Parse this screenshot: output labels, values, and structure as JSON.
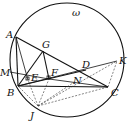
{
  "diagram": {
    "type": "geometry",
    "circle": {
      "name": "ω",
      "cx": 67,
      "cy": 60,
      "r": 57
    },
    "points": {
      "A": {
        "x": 16,
        "y": 37,
        "lx": 6,
        "ly": 38,
        "label": "A"
      },
      "G": {
        "x": 43,
        "y": 51,
        "lx": 42,
        "ly": 48,
        "label": "G"
      },
      "M": {
        "x": 10,
        "y": 72,
        "lx": 0,
        "ly": 76,
        "label": "M"
      },
      "E": {
        "x": 28,
        "y": 80,
        "lx": 31,
        "ly": 81,
        "label": "E"
      },
      "F": {
        "x": 49,
        "y": 79,
        "lx": 51,
        "ly": 76,
        "label": "F"
      },
      "D": {
        "x": 86,
        "y": 70,
        "lx": 82,
        "ly": 68,
        "label": "D"
      },
      "N": {
        "x": 76,
        "y": 81,
        "lx": 73,
        "ly": 84,
        "label": "N"
      },
      "K": {
        "x": 117,
        "y": 61,
        "lx": 119,
        "ly": 64,
        "label": "K"
      },
      "B": {
        "x": 18,
        "y": 86,
        "lx": 7,
        "ly": 96,
        "label": "B"
      },
      "C": {
        "x": 108,
        "y": 87,
        "lx": 111,
        "ly": 96,
        "label": "C"
      },
      "J": {
        "x": 38,
        "y": 106,
        "lx": 30,
        "ly": 119,
        "label": "J"
      }
    },
    "omega_label": {
      "text": "ω",
      "x": 72,
      "y": 16
    }
  }
}
